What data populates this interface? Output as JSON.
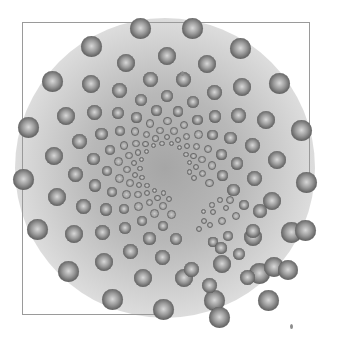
{
  "image": {
    "width": 343,
    "height": 343,
    "background": "#ffffff",
    "center_shade": "#a6a6a6",
    "frame_color": "#9a9a9a"
  },
  "frame": {
    "top": {
      "x1": 22,
      "y1": 22,
      "x2": 309,
      "y2": 22
    },
    "left": {
      "x1": 22,
      "y1": 22,
      "x2": 22,
      "y2": 314
    },
    "right": {
      "x1": 309,
      "y1": 22,
      "x2": 309,
      "y2": 180
    },
    "bottom": {
      "x1": 22,
      "y1": 314,
      "x2": 158,
      "y2": 314
    }
  },
  "main_spiral": {
    "cx": 165,
    "cy": 168,
    "glow_radius": 150,
    "rings": [
      {
        "radius": 142,
        "ball_r": 10.5,
        "count": 17,
        "offset_deg": -100
      },
      {
        "radius": 112,
        "ball_r": 9,
        "count": 17,
        "offset_deg": -89
      },
      {
        "radius": 90,
        "ball_r": 7.5,
        "count": 17,
        "offset_deg": -78
      },
      {
        "radius": 72,
        "ball_r": 6.2,
        "count": 17,
        "offset_deg": -67
      },
      {
        "radius": 58,
        "ball_r": 5.2,
        "count": 17,
        "offset_deg": -56
      },
      {
        "radius": 47,
        "ball_r": 4.4,
        "count": 17,
        "offset_deg": -45
      },
      {
        "radius": 38,
        "ball_r": 3.7,
        "count": 17,
        "offset_deg": -34
      },
      {
        "radius": 31,
        "ball_r": 3.1,
        "count": 17,
        "offset_deg": -23
      },
      {
        "radius": 25,
        "ball_r": 2.6,
        "count": 17,
        "offset_deg": -12
      }
    ],
    "omit_sector_deg": [
      20,
      75
    ]
  },
  "secondary_cluster": {
    "balls": [
      {
        "x": 203,
        "y": 211,
        "r": 2.5
      },
      {
        "x": 212,
        "y": 205,
        "r": 2.6
      },
      {
        "x": 220,
        "y": 200,
        "r": 2.8
      },
      {
        "x": 204,
        "y": 221,
        "r": 3
      },
      {
        "x": 199,
        "y": 229,
        "r": 3.2
      },
      {
        "x": 213,
        "y": 212,
        "r": 3
      },
      {
        "x": 226,
        "y": 208,
        "r": 3.4
      },
      {
        "x": 210,
        "y": 225,
        "r": 3.4
      },
      {
        "x": 222,
        "y": 221,
        "r": 4
      },
      {
        "x": 236,
        "y": 216,
        "r": 4.4
      },
      {
        "x": 230,
        "y": 200,
        "r": 4.2
      },
      {
        "x": 244,
        "y": 205,
        "r": 4.8
      },
      {
        "x": 213,
        "y": 242,
        "r": 4.6
      },
      {
        "x": 228,
        "y": 236,
        "r": 5
      },
      {
        "x": 239,
        "y": 254,
        "r": 6.2
      },
      {
        "x": 221,
        "y": 248,
        "r": 5.6
      },
      {
        "x": 253,
        "y": 231,
        "r": 7
      },
      {
        "x": 260,
        "y": 211,
        "r": 7
      },
      {
        "x": 247,
        "y": 277,
        "r": 7.5
      },
      {
        "x": 209,
        "y": 285,
        "r": 7.5
      },
      {
        "x": 274,
        "y": 267,
        "r": 10
      },
      {
        "x": 288,
        "y": 270,
        "r": 10
      },
      {
        "x": 305,
        "y": 230,
        "r": 10.5
      },
      {
        "x": 268,
        "y": 300,
        "r": 10.5
      },
      {
        "x": 219,
        "y": 317,
        "r": 10.5
      },
      {
        "x": 191,
        "y": 269,
        "r": 7.5
      }
    ]
  },
  "specks": [
    {
      "x": 181,
      "y": 71
    },
    {
      "x": 290,
      "y": 324
    }
  ]
}
